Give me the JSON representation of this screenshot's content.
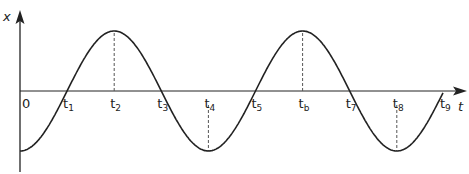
{
  "diagram": {
    "type": "displacement-time graph",
    "y_axis_label": "x",
    "x_axis_label": "t",
    "origin_label": "0",
    "curve": "negative cosine, starts at minimum, 2.25 cycles",
    "time_labels": [
      {
        "base": "t",
        "sub": "1",
        "phase": "zero-crossing"
      },
      {
        "base": "t",
        "sub": "2",
        "phase": "maximum"
      },
      {
        "base": "t",
        "sub": "3",
        "phase": "zero-crossing"
      },
      {
        "base": "t",
        "sub": "4",
        "phase": "minimum"
      },
      {
        "base": "t",
        "sub": "5",
        "phase": "zero-crossing"
      },
      {
        "base": "t",
        "sub": "b",
        "phase": "maximum"
      },
      {
        "base": "t",
        "sub": "7",
        "phase": "zero-crossing"
      },
      {
        "base": "t",
        "sub": "8",
        "phase": "minimum"
      },
      {
        "base": "t",
        "sub": "9",
        "phase": "zero-crossing"
      }
    ],
    "colors": {
      "line": "#222222",
      "dashed": "#555555"
    }
  }
}
